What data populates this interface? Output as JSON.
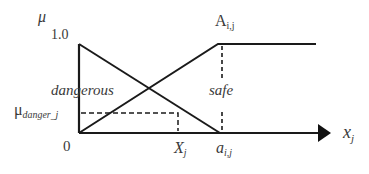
{
  "diagram": {
    "y_axis": {
      "label": "μ",
      "max_tick": "1.0",
      "origin": "0"
    },
    "x_axis": {
      "label_main": "x",
      "label_sub": "j"
    },
    "sets": [
      {
        "name": "dangerous",
        "label": "dangerous",
        "shape": "decreasing",
        "from": [
          0,
          1.0
        ],
        "to": [
          "a_i,j",
          0
        ]
      },
      {
        "name": "safe",
        "label": "safe",
        "shape": "increasing then flat",
        "from": [
          0,
          0
        ],
        "to": [
          "a_i,j",
          1.0
        ]
      }
    ],
    "labels": {
      "A": {
        "main": "A",
        "sub": "i,j"
      },
      "mu_danger": {
        "main": "μ",
        "sub": "danger_j"
      },
      "X": {
        "main": "X",
        "sub": "j"
      },
      "a": {
        "main": "a",
        "sub": "i,j"
      },
      "dangerous": "dangerous",
      "safe": "safe"
    },
    "colors": {
      "line": "#1a1a1a",
      "text": "#3a3a3a"
    }
  }
}
